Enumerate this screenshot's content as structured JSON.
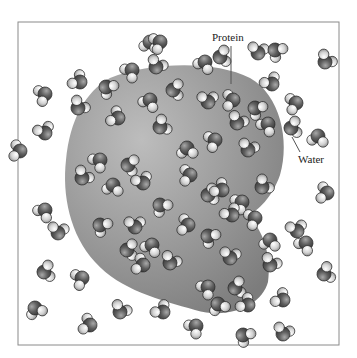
{
  "figure": {
    "frame": {
      "x": 18,
      "y": 22,
      "width": 321,
      "height": 323,
      "stroke": "#8a8a8a"
    },
    "labels": {
      "protein": {
        "text": "Protein",
        "x": 212,
        "y": 41
      },
      "water": {
        "text": "Water",
        "x": 298,
        "y": 163
      }
    },
    "leaders": {
      "protein": {
        "x1": 231,
        "y1": 46,
        "x2": 231,
        "y2": 84
      },
      "water": {
        "x1": 300,
        "y1": 152,
        "x2": 292,
        "y2": 137
      }
    },
    "colors": {
      "protein_fill": "#9a9a9a",
      "oxygen": "#5a5a5a",
      "hydrogen": "#d8d8d8",
      "outline": "#2a2a2a"
    },
    "protein_path": "M 110 78 C 150 62, 215 60, 250 78 C 280 95, 290 140, 280 175 C 272 198, 258 210, 248 216 C 262 228, 272 255, 268 282 C 262 305, 230 320, 195 310 C 160 300, 120 290, 95 262 C 70 235, 62 195, 66 160 C 70 120, 85 92, 110 78 Z",
    "molecules": [
      {
        "x": 150,
        "y": 42,
        "r": 0
      },
      {
        "x": 132,
        "y": 70,
        "r": 40
      },
      {
        "x": 156,
        "y": 67,
        "r": 200
      },
      {
        "x": 80,
        "y": 82,
        "r": 120
      },
      {
        "x": 106,
        "y": 87,
        "r": 300
      },
      {
        "x": 45,
        "y": 94,
        "r": 60
      },
      {
        "x": 78,
        "y": 108,
        "r": 210
      },
      {
        "x": 45,
        "y": 133,
        "r": 150
      },
      {
        "x": 20,
        "y": 151,
        "r": 90
      },
      {
        "x": 45,
        "y": 210,
        "r": 30
      },
      {
        "x": 44,
        "y": 272,
        "r": 250
      },
      {
        "x": 35,
        "y": 308,
        "r": 330
      },
      {
        "x": 90,
        "y": 325,
        "r": 100
      },
      {
        "x": 120,
        "y": 312,
        "r": 200
      },
      {
        "x": 160,
        "y": 42,
        "r": 60
      },
      {
        "x": 205,
        "y": 62,
        "r": 20
      },
      {
        "x": 220,
        "y": 57,
        "r": 250
      },
      {
        "x": 258,
        "y": 53,
        "r": 180
      },
      {
        "x": 275,
        "y": 50,
        "r": 300
      },
      {
        "x": 325,
        "y": 62,
        "r": 210
      },
      {
        "x": 272,
        "y": 84,
        "r": 140
      },
      {
        "x": 296,
        "y": 103,
        "r": 70
      },
      {
        "x": 291,
        "y": 128,
        "r": 250
      },
      {
        "x": 318,
        "y": 136,
        "r": 0
      },
      {
        "x": 327,
        "y": 193,
        "r": 90
      },
      {
        "x": 297,
        "y": 231,
        "r": 160
      },
      {
        "x": 306,
        "y": 243,
        "r": 30
      },
      {
        "x": 324,
        "y": 274,
        "r": 240
      },
      {
        "x": 283,
        "y": 300,
        "r": 120
      },
      {
        "x": 283,
        "y": 334,
        "r": 190
      },
      {
        "x": 243,
        "y": 335,
        "r": 300
      },
      {
        "x": 196,
        "y": 326,
        "r": 40
      },
      {
        "x": 163,
        "y": 312,
        "r": 130
      },
      {
        "x": 173,
        "y": 90,
        "r": 260
      },
      {
        "x": 150,
        "y": 100,
        "r": 20
      },
      {
        "x": 208,
        "y": 102,
        "r": 170
      },
      {
        "x": 233,
        "y": 100,
        "r": 80
      },
      {
        "x": 255,
        "y": 108,
        "r": 300
      },
      {
        "x": 237,
        "y": 123,
        "r": 200
      },
      {
        "x": 268,
        "y": 124,
        "r": 30
      },
      {
        "x": 118,
        "y": 118,
        "r": 110
      },
      {
        "x": 160,
        "y": 127,
        "r": 230
      },
      {
        "x": 187,
        "y": 148,
        "r": 350
      },
      {
        "x": 215,
        "y": 140,
        "r": 60
      },
      {
        "x": 248,
        "y": 150,
        "r": 190
      },
      {
        "x": 100,
        "y": 160,
        "r": 40
      },
      {
        "x": 128,
        "y": 165,
        "r": 270
      },
      {
        "x": 143,
        "y": 183,
        "r": 150
      },
      {
        "x": 113,
        "y": 185,
        "r": 0
      },
      {
        "x": 82,
        "y": 178,
        "r": 210
      },
      {
        "x": 190,
        "y": 175,
        "r": 80
      },
      {
        "x": 208,
        "y": 195,
        "r": 250
      },
      {
        "x": 222,
        "y": 190,
        "r": 120
      },
      {
        "x": 160,
        "y": 205,
        "r": 310
      },
      {
        "x": 242,
        "y": 202,
        "r": 50
      },
      {
        "x": 262,
        "y": 187,
        "r": 220
      },
      {
        "x": 135,
        "y": 227,
        "r": 170
      },
      {
        "x": 152,
        "y": 245,
        "r": 20
      },
      {
        "x": 127,
        "y": 250,
        "r": 260
      },
      {
        "x": 143,
        "y": 265,
        "r": 100
      },
      {
        "x": 170,
        "y": 263,
        "r": 200
      },
      {
        "x": 208,
        "y": 236,
        "r": 300
      },
      {
        "x": 232,
        "y": 215,
        "r": 140
      },
      {
        "x": 255,
        "y": 218,
        "r": 60
      },
      {
        "x": 230,
        "y": 258,
        "r": 180
      },
      {
        "x": 208,
        "y": 287,
        "r": 40
      },
      {
        "x": 235,
        "y": 288,
        "r": 250
      },
      {
        "x": 248,
        "y": 305,
        "r": 120
      },
      {
        "x": 218,
        "y": 304,
        "r": 330
      },
      {
        "x": 270,
        "y": 265,
        "r": 200
      },
      {
        "x": 270,
        "y": 240,
        "r": 0
      },
      {
        "x": 188,
        "y": 225,
        "r": 90
      },
      {
        "x": 100,
        "y": 225,
        "r": 300
      },
      {
        "x": 58,
        "y": 233,
        "r": 180
      },
      {
        "x": 82,
        "y": 278,
        "r": 60
      }
    ]
  }
}
